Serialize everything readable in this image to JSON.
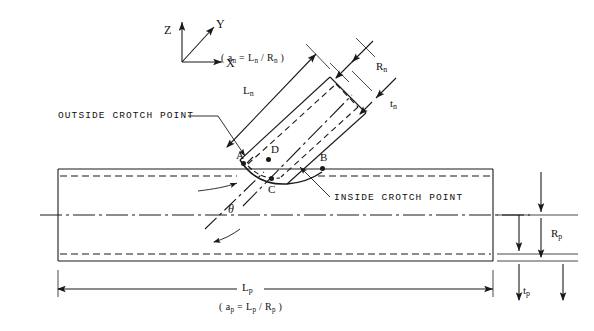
{
  "figure": {
    "background_color": "#ffffff",
    "line_color": "#1a1a1a"
  },
  "axes": {
    "z_label": "Z",
    "y_label": "Y",
    "x_label": "X"
  },
  "nozzle": {
    "length_label": "L",
    "length_sub": "n",
    "radius_label": "R",
    "radius_sub": "n",
    "thickness_label": "t",
    "thickness_sub": "n",
    "ratio_formula": "( a",
    "ratio_formula_sub1": "n",
    "ratio_formula_mid": " = L",
    "ratio_formula_sub2": "n",
    "ratio_formula_mid2": " / R",
    "ratio_formula_sub3": "n",
    "ratio_formula_end": " )"
  },
  "pipe": {
    "length_label": "L",
    "length_sub": "p",
    "radius_label": "R",
    "radius_sub": "p",
    "thickness_label": "t",
    "thickness_sub": "p",
    "ratio_formula": "( a",
    "ratio_formula_sub1": "p",
    "ratio_formula_mid": " = L",
    "ratio_formula_sub2": "p",
    "ratio_formula_mid2": " / R",
    "ratio_formula_sub3": "p",
    "ratio_formula_end": " )"
  },
  "callouts": {
    "outside_crotch": "OUTSIDE CROTCH POINT",
    "inside_crotch": "INSIDE CROTCH POINT"
  },
  "points": {
    "a": "A",
    "b": "B",
    "c": "C",
    "d": "D"
  },
  "angle": {
    "symbol": "θ"
  }
}
